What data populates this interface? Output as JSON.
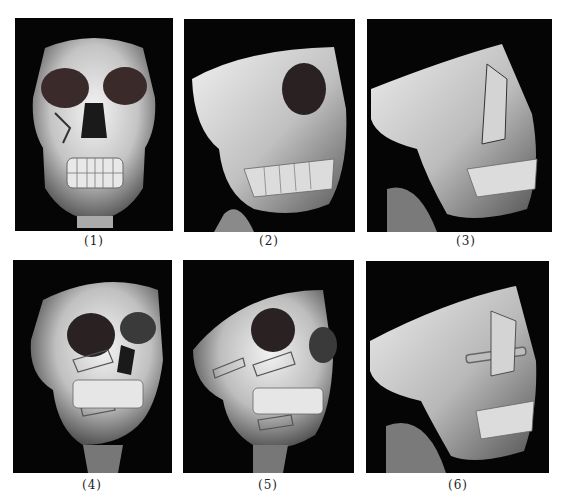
{
  "figure": {
    "panels": [
      {
        "id": 1,
        "label": "(1)",
        "view": "frontal",
        "description": "Preoperative 3D CT, frontal view, right orbital-zygomatic fracture",
        "fixation_plates": false
      },
      {
        "id": 2,
        "label": "(2)",
        "view": "right oblique",
        "description": "Preoperative 3D CT, oblique view showing comminuted zygomatic fracture",
        "fixation_plates": false
      },
      {
        "id": 3,
        "label": "(3)",
        "view": "right lateral",
        "description": "Preoperative 3D CT, lateral view with zygomatic arch fracture",
        "fixation_plates": false
      },
      {
        "id": 4,
        "label": "(4)",
        "view": "frontal oblique",
        "description": "Postoperative 3D CT, frontal oblique view with titanium plates",
        "fixation_plates": true
      },
      {
        "id": 5,
        "label": "(5)",
        "view": "right oblique",
        "description": "Postoperative 3D CT, oblique view with titanium plates",
        "fixation_plates": true
      },
      {
        "id": 6,
        "label": "(6)",
        "view": "right lateral",
        "description": "Postoperative 3D CT, lateral view with zygomatic arch plate",
        "fixation_plates": true
      }
    ],
    "colors": {
      "background": "#ffffff",
      "panel_background": "#050505",
      "bone_highlight": "#f2f2f2",
      "bone_mid": "#b5b5b5",
      "bone_shadow": "#4a4a4a",
      "plate": "#9a9a9a"
    }
  }
}
